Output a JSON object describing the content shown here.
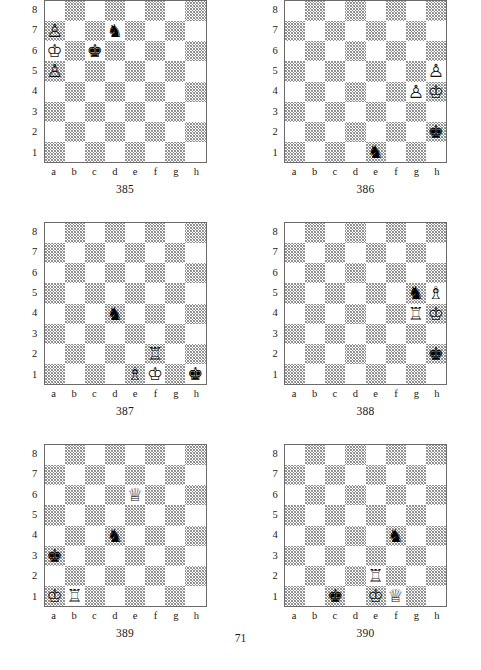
{
  "page": {
    "page_number": "71",
    "file_labels": [
      "a",
      "b",
      "c",
      "d",
      "e",
      "f",
      "g",
      "h"
    ],
    "rank_labels": [
      "8",
      "7",
      "6",
      "5",
      "4",
      "3",
      "2",
      "1"
    ],
    "light_square_color": "#ffffff",
    "dark_square_color": "#8a8a8a",
    "border_color": "#6b6b6b",
    "text_color": "#1a1a1a"
  },
  "glyphs": {
    "white_king": "♔",
    "white_queen": "♕",
    "white_rook": "♖",
    "white_bishop": "♗",
    "white_knight": "♘",
    "white_pawn": "♙",
    "black_king": "♚",
    "black_queen": "♛",
    "black_rook": "♜",
    "black_bishop": "♝",
    "black_knight": "♞",
    "black_pawn": "♟"
  },
  "diagrams": [
    {
      "number": "385",
      "pieces": [
        {
          "square": "a7",
          "color": "white",
          "type": "pawn",
          "glyph": "♙"
        },
        {
          "square": "d7",
          "color": "black",
          "type": "knight",
          "glyph": "♞"
        },
        {
          "square": "a6",
          "color": "white",
          "type": "king",
          "glyph": "♔"
        },
        {
          "square": "c6",
          "color": "black",
          "type": "king",
          "glyph": "♚"
        },
        {
          "square": "a5",
          "color": "white",
          "type": "pawn",
          "glyph": "♙"
        }
      ]
    },
    {
      "number": "386",
      "pieces": [
        {
          "square": "h5",
          "color": "white",
          "type": "pawn",
          "glyph": "♙"
        },
        {
          "square": "g4",
          "color": "white",
          "type": "pawn",
          "glyph": "♙"
        },
        {
          "square": "h4",
          "color": "white",
          "type": "king",
          "glyph": "♔"
        },
        {
          "square": "h2",
          "color": "black",
          "type": "king",
          "glyph": "♚"
        },
        {
          "square": "e1",
          "color": "black",
          "type": "knight",
          "glyph": "♞"
        }
      ]
    },
    {
      "number": "387",
      "pieces": [
        {
          "square": "d4",
          "color": "black",
          "type": "knight",
          "glyph": "♞"
        },
        {
          "square": "f2",
          "color": "white",
          "type": "rook",
          "glyph": "♖"
        },
        {
          "square": "e1",
          "color": "white",
          "type": "bishop",
          "glyph": "♗"
        },
        {
          "square": "f1",
          "color": "white",
          "type": "king",
          "glyph": "♔"
        },
        {
          "square": "h1",
          "color": "black",
          "type": "king",
          "glyph": "♚"
        }
      ]
    },
    {
      "number": "388",
      "pieces": [
        {
          "square": "g5",
          "color": "black",
          "type": "knight",
          "glyph": "♞"
        },
        {
          "square": "h5",
          "color": "white",
          "type": "bishop",
          "glyph": "♗"
        },
        {
          "square": "g4",
          "color": "white",
          "type": "rook",
          "glyph": "♖"
        },
        {
          "square": "h4",
          "color": "white",
          "type": "king",
          "glyph": "♔"
        },
        {
          "square": "h2",
          "color": "black",
          "type": "king",
          "glyph": "♚"
        }
      ]
    },
    {
      "number": "389",
      "pieces": [
        {
          "square": "e6",
          "color": "white",
          "type": "queen",
          "glyph": "♕"
        },
        {
          "square": "d4",
          "color": "black",
          "type": "knight",
          "glyph": "♞"
        },
        {
          "square": "a3",
          "color": "black",
          "type": "king",
          "glyph": "♚"
        },
        {
          "square": "a1",
          "color": "white",
          "type": "king",
          "glyph": "♔"
        },
        {
          "square": "b1",
          "color": "white",
          "type": "rook",
          "glyph": "♖"
        }
      ]
    },
    {
      "number": "390",
      "pieces": [
        {
          "square": "f4",
          "color": "black",
          "type": "knight",
          "glyph": "♞"
        },
        {
          "square": "e2",
          "color": "white",
          "type": "rook",
          "glyph": "♖"
        },
        {
          "square": "c1",
          "color": "black",
          "type": "king",
          "glyph": "♚"
        },
        {
          "square": "e1",
          "color": "white",
          "type": "king",
          "glyph": "♔"
        },
        {
          "square": "f1",
          "color": "white",
          "type": "queen",
          "glyph": "♕"
        }
      ]
    }
  ]
}
